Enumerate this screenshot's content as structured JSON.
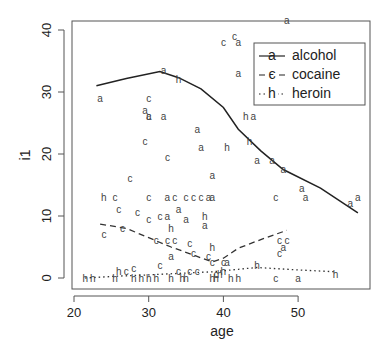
{
  "chart_data": {
    "type": "scatter",
    "title": "",
    "xlabel": "age",
    "ylabel": "i1",
    "xlim": [
      19.5,
      59
    ],
    "ylim": [
      -1.5,
      41.5
    ],
    "x_ticks": [
      20,
      30,
      40,
      50
    ],
    "y_ticks": [
      0,
      10,
      20,
      30,
      40
    ],
    "grid": false,
    "legend_position": "top-right",
    "legend": [
      {
        "label": "alcohol",
        "symbol": "a",
        "line": "solid"
      },
      {
        "label": "cocaine",
        "symbol": "c",
        "line": "dashed"
      },
      {
        "label": "heroin",
        "symbol": "h",
        "line": "dotted"
      }
    ],
    "series": [
      {
        "name": "alcohol",
        "symbol": "a",
        "points": [
          [
            23.5,
            29
          ],
          [
            29.5,
            27
          ],
          [
            30,
            26
          ],
          [
            32,
            33.5
          ],
          [
            32,
            26
          ],
          [
            36.5,
            24
          ],
          [
            42,
            38
          ],
          [
            42,
            33
          ],
          [
            44,
            26
          ],
          [
            37,
            21
          ],
          [
            38.5,
            16.5
          ],
          [
            44.5,
            19
          ],
          [
            46.5,
            19
          ],
          [
            38.5,
            13
          ],
          [
            32.5,
            13
          ],
          [
            38,
            13
          ],
          [
            48,
            17.5
          ],
          [
            50.5,
            14.5
          ],
          [
            51,
            13
          ],
          [
            57,
            12
          ],
          [
            58,
            13
          ],
          [
            34,
            11
          ],
          [
            32.5,
            10
          ],
          [
            35,
            9.5
          ],
          [
            37.5,
            8.5
          ],
          [
            33,
            3.5
          ],
          [
            40.5,
            2.5
          ],
          [
            50,
            0
          ],
          [
            48,
            5
          ],
          [
            48.5,
            41.5
          ]
        ],
        "smooth": [
          [
            23,
            31
          ],
          [
            27,
            32.2
          ],
          [
            31.5,
            33.3
          ],
          [
            34,
            32.3
          ],
          [
            37,
            30.5
          ],
          [
            40,
            27.5
          ],
          [
            42,
            24
          ],
          [
            45,
            20.5
          ],
          [
            48,
            17.5
          ],
          [
            53,
            14.5
          ],
          [
            58,
            10.5
          ]
        ]
      },
      {
        "name": "cocaine",
        "symbol": "c",
        "points": [
          [
            41.5,
            39
          ],
          [
            40,
            38
          ],
          [
            30,
            29
          ],
          [
            30,
            26
          ],
          [
            29.5,
            22
          ],
          [
            32.5,
            19.5
          ],
          [
            27.5,
            16
          ],
          [
            25.5,
            13
          ],
          [
            30,
            13
          ],
          [
            33.5,
            13
          ],
          [
            35,
            13
          ],
          [
            36,
            13
          ],
          [
            37,
            13
          ],
          [
            47,
            13
          ],
          [
            24,
            7
          ],
          [
            26,
            11
          ],
          [
            26.5,
            8
          ],
          [
            28.5,
            10.5
          ],
          [
            30,
            9.5
          ],
          [
            31.5,
            10
          ],
          [
            31,
            6
          ],
          [
            32.5,
            6
          ],
          [
            33.5,
            6
          ],
          [
            35.5,
            5.5
          ],
          [
            36,
            4
          ],
          [
            38,
            3.5
          ],
          [
            38.5,
            2.5
          ],
          [
            40,
            2.5
          ],
          [
            47.5,
            6
          ],
          [
            48.5,
            6
          ],
          [
            47.5,
            4
          ],
          [
            47,
            0
          ],
          [
            27,
            1
          ],
          [
            28,
            1.5
          ],
          [
            31.5,
            2
          ],
          [
            34,
            1
          ],
          [
            35.5,
            1
          ],
          [
            36.5,
            1
          ],
          [
            39,
            0.5
          ]
        ],
        "smooth": [
          [
            23.5,
            8.7
          ],
          [
            27,
            8
          ],
          [
            30,
            6.5
          ],
          [
            33,
            5
          ],
          [
            36,
            3.7
          ],
          [
            38.5,
            2.6
          ],
          [
            40,
            3.2
          ],
          [
            42,
            4.8
          ],
          [
            45,
            6.2
          ],
          [
            48.5,
            7.7
          ]
        ]
      },
      {
        "name": "heroin",
        "symbol": "h",
        "points": [
          [
            21.5,
            0
          ],
          [
            22.5,
            0
          ],
          [
            25.5,
            0
          ],
          [
            26,
            1
          ],
          [
            28,
            0
          ],
          [
            29,
            0
          ],
          [
            30,
            0
          ],
          [
            31,
            0
          ],
          [
            33,
            0
          ],
          [
            34.5,
            0
          ],
          [
            35,
            0
          ],
          [
            38.5,
            0
          ],
          [
            39,
            0
          ],
          [
            41,
            0
          ],
          [
            42,
            0
          ],
          [
            55,
            0.5
          ],
          [
            44.5,
            2
          ],
          [
            34,
            32
          ],
          [
            24,
            13
          ],
          [
            33,
            8
          ],
          [
            37.5,
            10
          ],
          [
            40.5,
            21
          ],
          [
            43,
            26
          ],
          [
            38.5,
            5
          ],
          [
            43.5,
            22
          ],
          [
            39.5,
            0.5
          ],
          [
            40,
            1
          ]
        ],
        "smooth": [
          [
            21.5,
            0
          ],
          [
            26,
            0.3
          ],
          [
            30,
            0.5
          ],
          [
            35,
            0.8
          ],
          [
            38.5,
            1.0
          ],
          [
            42,
            1.4
          ],
          [
            44.5,
            1.7
          ],
          [
            50,
            1.3
          ],
          [
            55,
            1.0
          ]
        ]
      }
    ]
  }
}
